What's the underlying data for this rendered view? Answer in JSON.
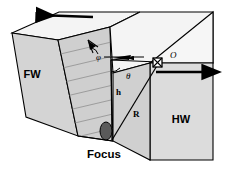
{
  "figure": {
    "type": "geologic-block-diagram",
    "background_color": "#ffffff",
    "line_color": "#000000"
  },
  "blocks": {
    "footwall": {
      "label": "FW",
      "name": "footwall-block",
      "face_color": "#d4d4d4",
      "top_color": "#f2f2f2"
    },
    "hangingwall": {
      "label": "HW",
      "name": "hangingwall-block",
      "face_color": "#d8d8d8",
      "top_color": "#f2f2f2"
    },
    "fault_plane": {
      "name": "fault-plane",
      "color": "#cfcfcf",
      "striation_color": "#8c8c8c",
      "striation_count": 8
    }
  },
  "markers": {
    "focus": {
      "label": "Focus",
      "name": "focus-hypocenter",
      "color": "#555555"
    },
    "station": {
      "label": "O",
      "name": "observation-station",
      "symbol": "square-with-x"
    }
  },
  "annotations": {
    "h": {
      "label": "h",
      "description": "focal depth"
    },
    "R": {
      "label": "R",
      "description": "hypocentral distance"
    },
    "theta": {
      "label": "θ",
      "description": "take-off / incidence angle"
    },
    "phi": {
      "label": "φ",
      "description": "azimuth angle"
    }
  },
  "motion_arrows": {
    "top_left": {
      "name": "footwall-motion-arrow",
      "direction": "left"
    },
    "right": {
      "name": "hangingwall-motion-arrow",
      "direction": "right"
    }
  }
}
